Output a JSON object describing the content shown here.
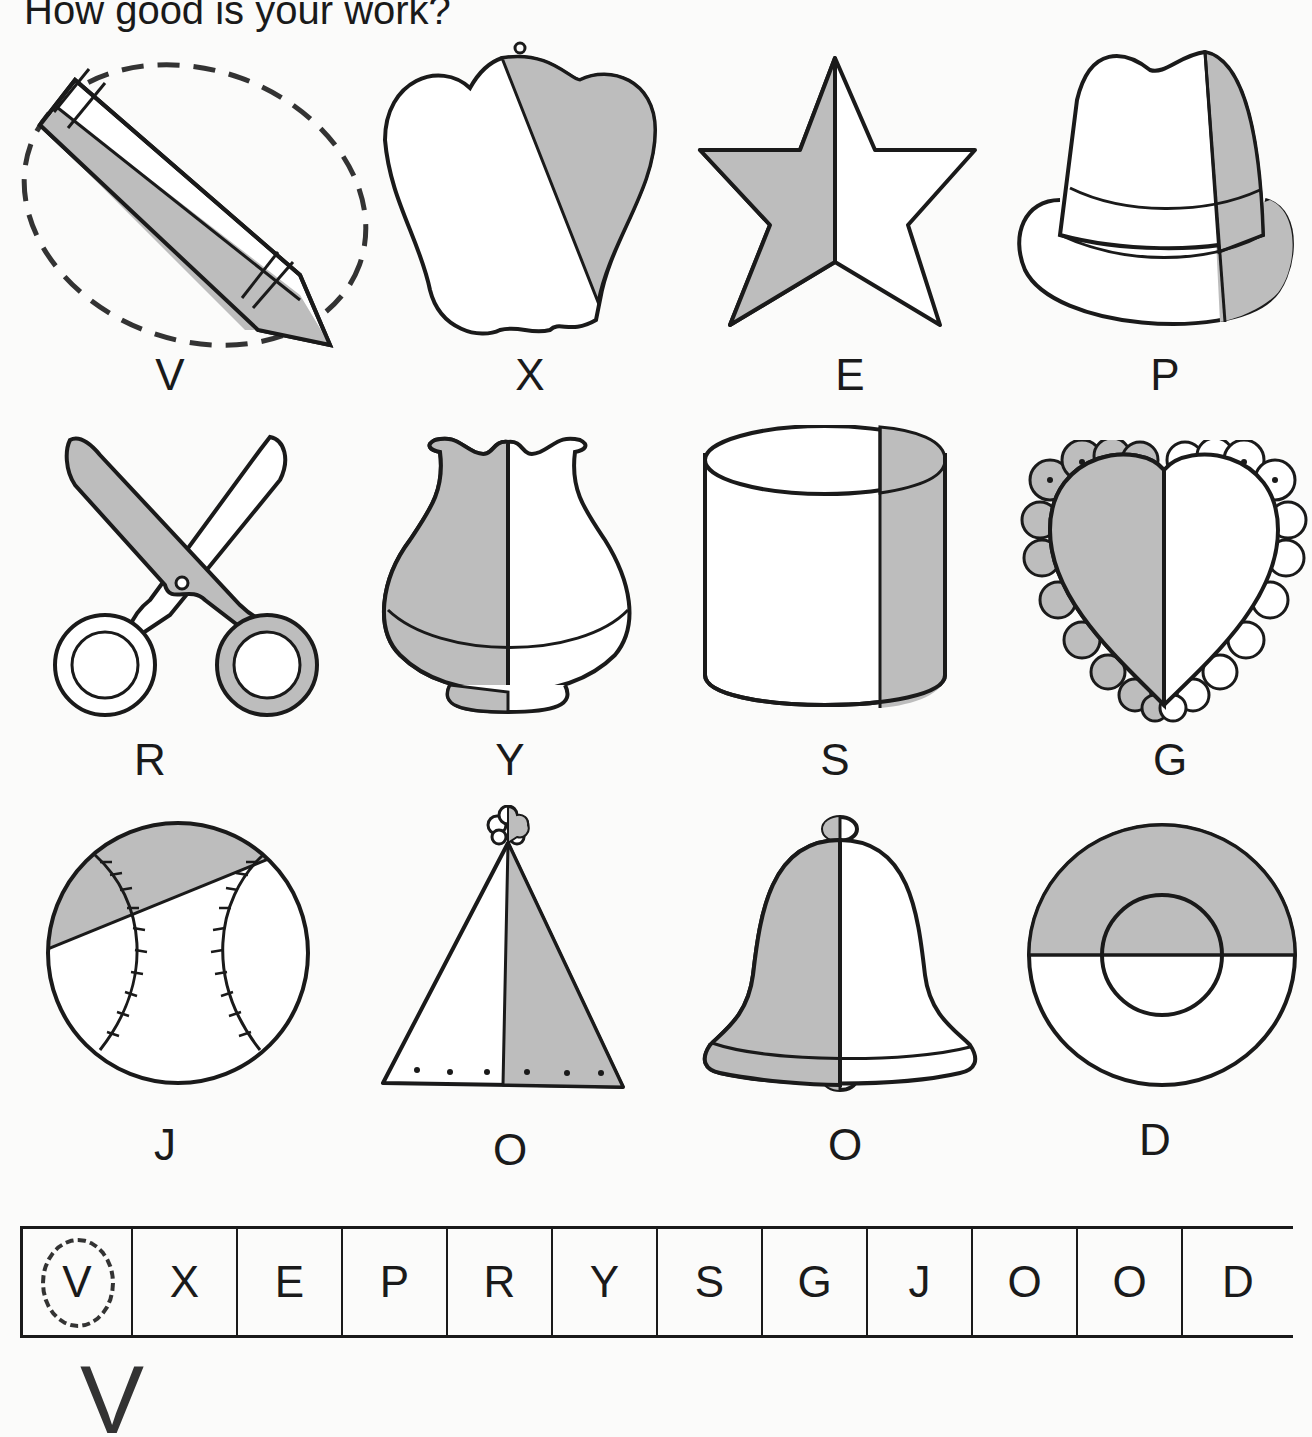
{
  "title": "How good is your work?",
  "colors": {
    "shade": "#bdbdbd",
    "ink": "#1a1a1a",
    "paper": "#fbfbfa"
  },
  "pictures": [
    {
      "object": "crayon",
      "letter": "V",
      "circled": true,
      "shading": "lower half shaded"
    },
    {
      "object": "pepper",
      "letter": "X",
      "circled": false,
      "shading": "diagonal part shaded"
    },
    {
      "object": "star",
      "letter": "E",
      "circled": false,
      "shading": "left half shaded"
    },
    {
      "object": "hat",
      "letter": "P",
      "circled": false,
      "shading": "right sliver shaded"
    },
    {
      "object": "scissors",
      "letter": "R",
      "circled": false,
      "shading": "one blade shaded"
    },
    {
      "object": "vase",
      "letter": "Y",
      "circled": false,
      "shading": "left half shaded"
    },
    {
      "object": "cylinder",
      "letter": "S",
      "circled": false,
      "shading": "right sliver shaded"
    },
    {
      "object": "heart",
      "letter": "G",
      "circled": false,
      "shading": "left half shaded"
    },
    {
      "object": "baseball",
      "letter": "J",
      "circled": false,
      "shading": "top segment shaded"
    },
    {
      "object": "party-hat",
      "letter": "O",
      "circled": false,
      "shading": "right half shaded"
    },
    {
      "object": "bell",
      "letter": "O",
      "circled": false,
      "shading": "left half shaded"
    },
    {
      "object": "ring",
      "letter": "D",
      "circled": false,
      "shading": "top half shaded"
    }
  ],
  "answer_strip": [
    "V",
    "X",
    "E",
    "P",
    "R",
    "Y",
    "S",
    "G",
    "J",
    "O",
    "O",
    "D"
  ],
  "answer_strip_circled_index": 0,
  "result_letters": "V"
}
